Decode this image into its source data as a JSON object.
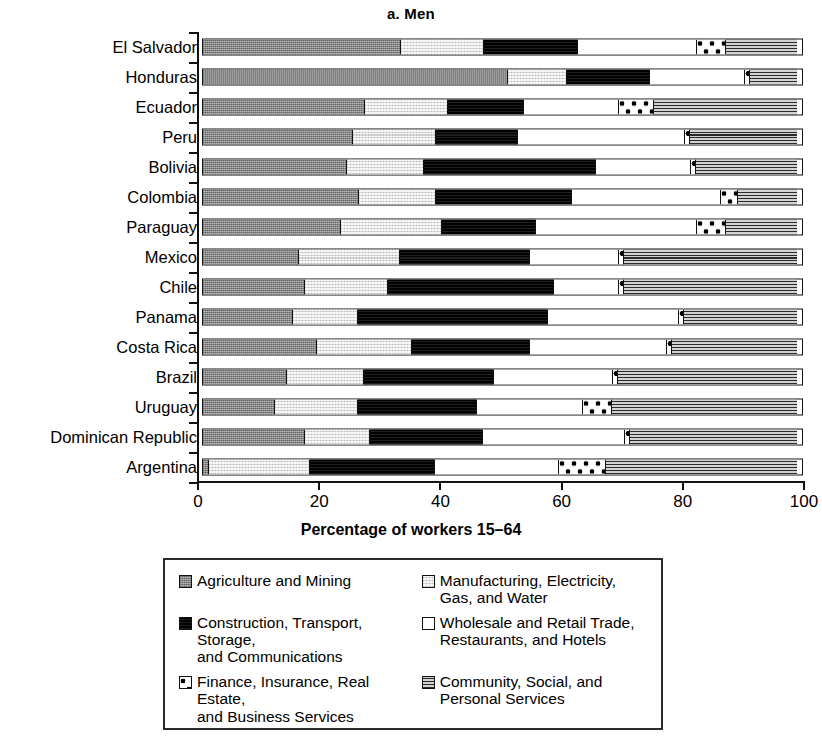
{
  "title": "a. Men",
  "axis": {
    "x_title": "Percentage of workers 15–64",
    "x_ticks": [
      "0",
      "20",
      "40",
      "60",
      "80",
      "100"
    ]
  },
  "legend": {
    "items": [
      {
        "key": "agri",
        "label": "Agriculture and Mining",
        "pattern": "solid-gray-speckle"
      },
      {
        "key": "manu",
        "label": "Manufacturing, Electricity,\nGas, and Water",
        "pattern": "light-gray-speckle"
      },
      {
        "key": "cons",
        "label": "Construction, Transport, Storage,\nand Communications",
        "pattern": "black"
      },
      {
        "key": "whol",
        "label": "Wholesale and Retail Trade,\nRestaurants, and Hotels",
        "pattern": "white"
      },
      {
        "key": "fina",
        "label": "Finance, Insurance, Real Estate,\nand Business Services",
        "pattern": "white-with-dots"
      },
      {
        "key": "comm",
        "label": "Community, Social, and\nPersonal Services",
        "pattern": "horizontal-lines-gray"
      }
    ]
  },
  "chart_data": {
    "type": "bar",
    "orientation": "horizontal",
    "stacked": true,
    "normalized": true,
    "title": "a. Men",
    "xlabel": "Percentage of workers 15–64",
    "ylabel": "",
    "xlim": [
      0,
      100
    ],
    "xticks": [
      0,
      20,
      40,
      60,
      80,
      100
    ],
    "grid": false,
    "legend_position": "below-plot",
    "categories": [
      "El Salvador",
      "Honduras",
      "Ecuador",
      "Peru",
      "Bolivia",
      "Colombia",
      "Paraguay",
      "Mexico",
      "Chile",
      "Panama",
      "Costa Rica",
      "Brazil",
      "Uruguay",
      "Dominican Republic",
      "Argentina"
    ],
    "series": [
      {
        "name": "Agriculture and Mining",
        "values": [
          33,
          51,
          27,
          25,
          24,
          26,
          23,
          16,
          17,
          15,
          19,
          14,
          12,
          17,
          1
        ]
      },
      {
        "name": "Manufacturing, Electricity, Gas, and Water",
        "values": [
          14,
          10,
          14,
          14,
          13,
          13,
          17,
          17,
          14,
          11,
          16,
          13,
          14,
          11,
          17
        ]
      },
      {
        "name": "Construction, Transport, Storage, and Communications",
        "values": [
          16,
          14,
          13,
          14,
          29,
          23,
          16,
          22,
          28,
          32,
          20,
          22,
          20,
          19,
          21
        ]
      },
      {
        "name": "Wholesale and Retail Trade, Restaurants, and Hotels",
        "values": [
          20,
          16,
          16,
          28,
          16,
          25,
          27,
          15,
          11,
          22,
          23,
          20,
          18,
          24,
          21
        ]
      },
      {
        "name": "Finance, Insurance, Real Estate, and Business Services",
        "values": [
          5,
          1,
          6,
          1,
          1,
          3,
          5,
          1,
          1,
          1,
          1,
          1,
          5,
          1,
          8
        ]
      },
      {
        "name": "Community, Social, and Personal Services",
        "values": [
          12,
          8,
          24,
          18,
          17,
          10,
          12,
          29,
          29,
          19,
          21,
          30,
          31,
          28,
          32
        ]
      }
    ],
    "rows": [
      {
        "label": "El Salvador",
        "segments": [
          33,
          14,
          16,
          20,
          5,
          12
        ]
      },
      {
        "label": "Honduras",
        "segments": [
          51,
          10,
          14,
          16,
          1,
          8
        ]
      },
      {
        "label": "Ecuador",
        "segments": [
          27,
          14,
          13,
          16,
          6,
          24
        ]
      },
      {
        "label": "Peru",
        "segments": [
          25,
          14,
          14,
          28,
          1,
          18
        ]
      },
      {
        "label": "Bolivia",
        "segments": [
          24,
          13,
          29,
          16,
          1,
          17
        ]
      },
      {
        "label": "Colombia",
        "segments": [
          26,
          13,
          23,
          25,
          3,
          10
        ]
      },
      {
        "label": "Paraguay",
        "segments": [
          23,
          17,
          16,
          27,
          5,
          12
        ]
      },
      {
        "label": "Mexico",
        "segments": [
          16,
          17,
          22,
          15,
          1,
          29
        ]
      },
      {
        "label": "Chile",
        "segments": [
          17,
          14,
          28,
          11,
          1,
          29
        ]
      },
      {
        "label": "Panama",
        "segments": [
          15,
          11,
          32,
          22,
          1,
          19
        ]
      },
      {
        "label": "Costa Rica",
        "segments": [
          19,
          16,
          20,
          23,
          1,
          21
        ]
      },
      {
        "label": "Brazil",
        "segments": [
          14,
          13,
          22,
          20,
          1,
          30
        ]
      },
      {
        "label": "Uruguay",
        "segments": [
          12,
          14,
          20,
          18,
          5,
          31
        ]
      },
      {
        "label": "Dominican Republic",
        "segments": [
          17,
          11,
          19,
          24,
          1,
          28
        ]
      },
      {
        "label": "Argentina",
        "segments": [
          1,
          17,
          21,
          21,
          8,
          32
        ]
      }
    ]
  }
}
